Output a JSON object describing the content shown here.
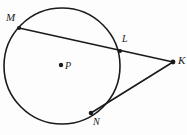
{
  "figure": {
    "background_color": "#fdfdfd",
    "stroke_color": "#1a1a1a",
    "labels": {
      "m": "M",
      "l": "L",
      "k": "K",
      "n": "N",
      "p": "P"
    },
    "geometry": {
      "circle": {
        "cx": 62,
        "cy": 66,
        "r": 58
      },
      "center_dot": {
        "cx": 61,
        "cy": 65,
        "r": 2.2
      },
      "points": {
        "M": {
          "x": 19,
          "y": 28
        },
        "L": {
          "x": 120,
          "y": 51
        },
        "K": {
          "x": 173,
          "y": 62
        },
        "N": {
          "x": 91,
          "y": 113
        }
      },
      "segments": [
        {
          "name": "secant-MLK",
          "from": "M",
          "to": "K"
        },
        {
          "name": "secant-KN",
          "from": "K",
          "to": "N"
        }
      ],
      "dots": [
        "M",
        "L",
        "K",
        "N",
        "P"
      ]
    }
  }
}
